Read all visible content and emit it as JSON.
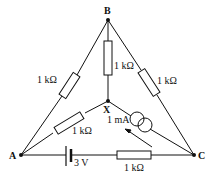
{
  "diagram": {
    "type": "circuit",
    "nodes": {
      "A": "A",
      "B": "B",
      "C": "C",
      "X": "X"
    },
    "components": {
      "r_AB": "1 kΩ",
      "r_BX": "1 kΩ",
      "r_BC": "1 kΩ",
      "r_AX": "1 kΩ",
      "r_AC": "1 kΩ",
      "battery": "3 V",
      "current_source": "1 mA"
    },
    "colors": {
      "line": "#111111",
      "background": "#ffffff"
    }
  }
}
